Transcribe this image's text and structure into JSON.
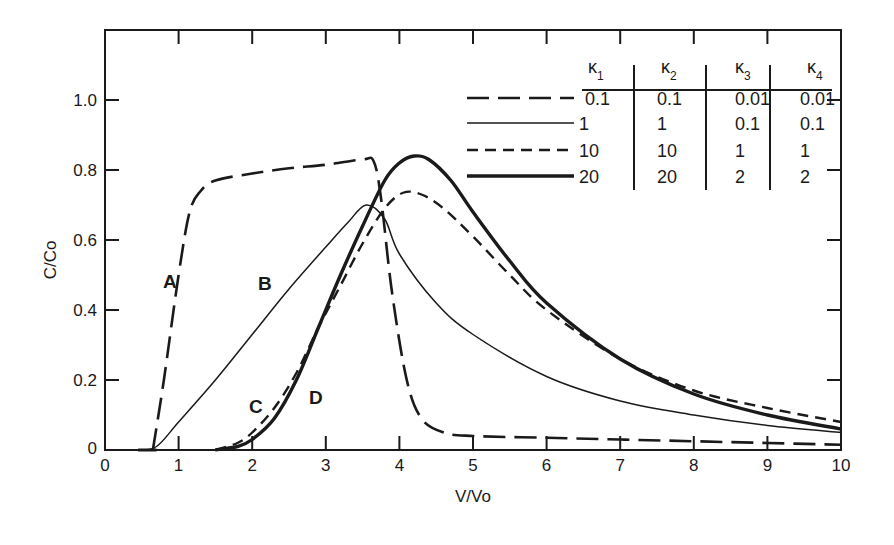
{
  "chart_data": {
    "type": "line",
    "title": "",
    "xlabel": "V/Vo",
    "ylabel": "C/Co",
    "xlim": [
      0,
      10
    ],
    "ylim": [
      0,
      1.2
    ],
    "xticks": [
      "0",
      "1",
      "2",
      "3",
      "4",
      "5",
      "6",
      "7",
      "8",
      "9",
      "10"
    ],
    "yticks": [
      "0",
      "0.2",
      "0.4",
      "0.6",
      "0.8",
      "1.0"
    ],
    "grid": false,
    "legend_position": "upper right (table)",
    "legend_table": {
      "headers": [
        "κ1",
        "κ2",
        "κ3",
        "κ4"
      ],
      "rows": [
        {
          "style": "long-dash",
          "values": [
            "0.1",
            "0.1",
            "0.01",
            "0.01"
          ]
        },
        {
          "style": "thin-solid",
          "values": [
            "1",
            "1",
            "0.1",
            "0.1"
          ]
        },
        {
          "style": "short-dash",
          "values": [
            "10",
            "10",
            "1",
            "1"
          ]
        },
        {
          "style": "thick-solid",
          "values": [
            "20",
            "20",
            "2",
            "2"
          ]
        }
      ]
    },
    "series": [
      {
        "name": "A",
        "style": "long-dash",
        "x": [
          0.65,
          0.8,
          1.0,
          1.15,
          1.3,
          1.5,
          2.0,
          2.5,
          3.0,
          3.5,
          3.65,
          3.75,
          3.9,
          4.1,
          4.3,
          4.6,
          5.0,
          6.0,
          7.0,
          8.0,
          9.0,
          10.0
        ],
        "y": [
          0.0,
          0.2,
          0.5,
          0.68,
          0.74,
          0.77,
          0.79,
          0.805,
          0.815,
          0.83,
          0.825,
          0.72,
          0.45,
          0.2,
          0.09,
          0.05,
          0.04,
          0.035,
          0.03,
          0.025,
          0.02,
          0.015
        ]
      },
      {
        "name": "B",
        "style": "thin-solid",
        "x": [
          0.45,
          0.7,
          1.0,
          1.5,
          2.0,
          2.5,
          3.0,
          3.3,
          3.55,
          3.8,
          4.0,
          4.5,
          5.0,
          6.0,
          7.0,
          8.0,
          9.0,
          10.0
        ],
        "y": [
          0.0,
          0.01,
          0.08,
          0.2,
          0.33,
          0.46,
          0.58,
          0.65,
          0.7,
          0.66,
          0.56,
          0.42,
          0.33,
          0.21,
          0.14,
          0.1,
          0.07,
          0.05
        ]
      },
      {
        "name": "C",
        "style": "short-dash",
        "x": [
          1.5,
          1.8,
          2.0,
          2.3,
          2.6,
          2.9,
          3.2,
          3.5,
          3.8,
          4.05,
          4.3,
          4.6,
          5.0,
          5.5,
          6.0,
          7.0,
          8.0,
          9.0,
          10.0
        ],
        "y": [
          0.0,
          0.02,
          0.05,
          0.12,
          0.22,
          0.35,
          0.47,
          0.59,
          0.69,
          0.735,
          0.73,
          0.69,
          0.61,
          0.5,
          0.4,
          0.26,
          0.17,
          0.12,
          0.08
        ]
      },
      {
        "name": "D",
        "style": "thick-solid",
        "x": [
          1.5,
          1.8,
          2.0,
          2.3,
          2.6,
          2.9,
          3.2,
          3.5,
          3.8,
          4.0,
          4.2,
          4.4,
          4.7,
          5.0,
          5.5,
          6.0,
          7.0,
          8.0,
          9.0,
          10.0
        ],
        "y": [
          0.0,
          0.01,
          0.03,
          0.09,
          0.2,
          0.35,
          0.5,
          0.64,
          0.77,
          0.82,
          0.84,
          0.83,
          0.77,
          0.68,
          0.54,
          0.42,
          0.26,
          0.16,
          0.1,
          0.06
        ]
      }
    ],
    "annotations": [
      "A",
      "B",
      "C",
      "D"
    ]
  }
}
